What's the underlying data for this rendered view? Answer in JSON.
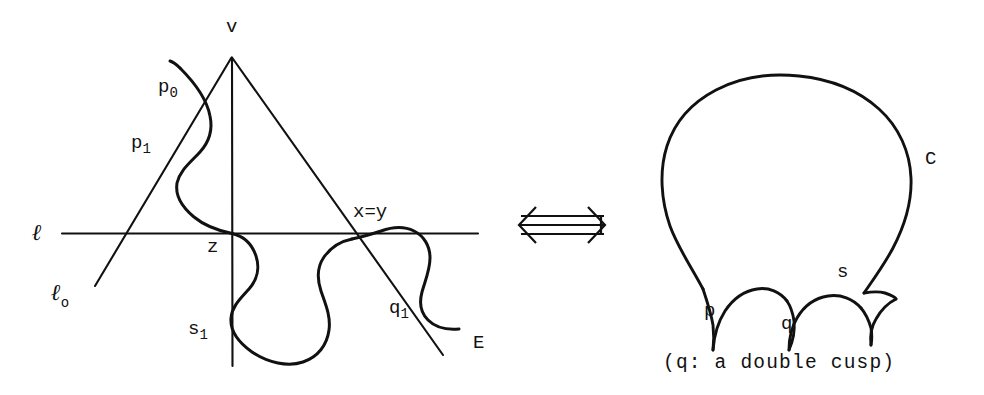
{
  "figure": {
    "background_color": "#ffffff",
    "ink_color": "#111111"
  },
  "left_diagram": {
    "name": "branch-curve-diagram",
    "labels": {
      "vertex": "v",
      "p_zero": "p",
      "p_zero_sub": "0",
      "p_one": "p",
      "p_one_sub": "1",
      "line_l": "ℓ",
      "line_l_zero": "ℓ",
      "line_l_zero_sub": "o",
      "origin": "z",
      "diagonal": "x=y",
      "s_one": "s",
      "s_one_sub": "1",
      "q_one": "q",
      "q_one_sub": "1",
      "curve_e": "E"
    }
  },
  "connector": {
    "name": "equivalence-arrow",
    "glyph": "⟺",
    "description": "double-headed horizontal arrow"
  },
  "right_diagram": {
    "name": "cusp-curve-diagram",
    "labels": {
      "curve": "C",
      "cusp_p": "p",
      "cusp_q": "q",
      "cusp_s": "s"
    },
    "caption": "(q: a double cusp)"
  }
}
